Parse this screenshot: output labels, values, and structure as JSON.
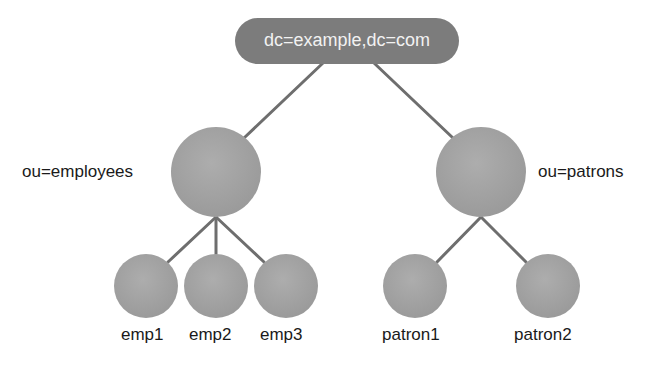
{
  "diagram": {
    "type": "tree",
    "colors": {
      "root_fill": "#7c7c7c",
      "node_fill": "#a3a3a3",
      "edge": "#6e6e6e",
      "text_dark": "#1a1a1a",
      "text_light": "#f2f2f2"
    },
    "root": {
      "label": "dc=example,dc=com"
    },
    "branches": [
      {
        "label": "ou=employees",
        "children": [
          {
            "label": "emp1"
          },
          {
            "label": "emp2"
          },
          {
            "label": "emp3"
          }
        ]
      },
      {
        "label": "ou=patrons",
        "children": [
          {
            "label": "patron1"
          },
          {
            "label": "patron2"
          }
        ]
      }
    ]
  }
}
